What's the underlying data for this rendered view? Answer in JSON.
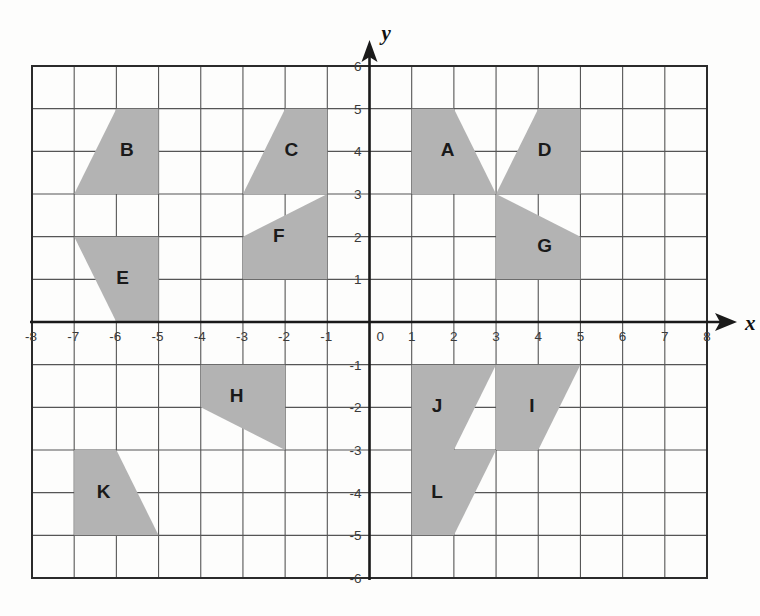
{
  "figure": {
    "type": "coordinate-grid",
    "background_color": "#fdfdfc",
    "grid_line_color": "#555555",
    "grid_border_color": "#2b2b2b",
    "axis_color": "#1a1a1a",
    "shape_fill_color": "#b3b3b3",
    "shape_label_color": "#1a1a1a",
    "x_axis_name": "x",
    "y_axis_name": "y",
    "origin_label": "0"
  },
  "chart_data": {
    "type": "scatter",
    "title": "",
    "xlabel": "x",
    "ylabel": "y",
    "xlim": [
      -8,
      8
    ],
    "ylim": [
      -6,
      6
    ],
    "grid": true,
    "legend": "none",
    "x_ticks": [
      -8,
      -7,
      -6,
      -5,
      -4,
      -3,
      -2,
      -1,
      0,
      1,
      2,
      3,
      4,
      5,
      6,
      7,
      8
    ],
    "x_tick_labels": [
      "-8",
      "-7",
      "-6",
      "-5",
      "-4",
      "-3",
      "-2",
      "-1",
      "0",
      "1",
      "2",
      "3",
      "4",
      "5",
      "6",
      "7",
      "8"
    ],
    "y_ticks": [
      6,
      5,
      4,
      3,
      2,
      1,
      -1,
      -2,
      -3,
      -4,
      -5,
      -6
    ],
    "y_tick_labels": [
      "6",
      "5",
      "4",
      "3",
      "2",
      "1",
      "-1",
      "-2",
      "-3",
      "-4",
      "-5",
      "-6"
    ],
    "shapes": [
      {
        "label": "A",
        "label_at": [
          1.85,
          4.0
        ],
        "vertices": [
          [
            1,
            5
          ],
          [
            2,
            5
          ],
          [
            3,
            3
          ],
          [
            1,
            3
          ]
        ]
      },
      {
        "label": "B",
        "label_at": [
          -5.75,
          4.0
        ],
        "vertices": [
          [
            -6,
            5
          ],
          [
            -5,
            5
          ],
          [
            -5,
            3
          ],
          [
            -7,
            3
          ]
        ]
      },
      {
        "label": "C",
        "label_at": [
          -1.85,
          4.0
        ],
        "vertices": [
          [
            -2,
            5
          ],
          [
            -1,
            5
          ],
          [
            -1,
            3
          ],
          [
            -3,
            3
          ]
        ]
      },
      {
        "label": "D",
        "label_at": [
          4.15,
          4.0
        ],
        "vertices": [
          [
            3,
            3
          ],
          [
            4,
            5
          ],
          [
            5,
            5
          ],
          [
            5,
            3
          ]
        ]
      },
      {
        "label": "E",
        "label_at": [
          -5.85,
          1.0
        ],
        "vertices": [
          [
            -7,
            2
          ],
          [
            -5,
            2
          ],
          [
            -5,
            0
          ],
          [
            -6,
            0
          ]
        ]
      },
      {
        "label": "F",
        "label_at": [
          -2.15,
          2.0
        ],
        "vertices": [
          [
            -3,
            2
          ],
          [
            -1,
            3
          ],
          [
            -1,
            1
          ],
          [
            -3,
            1
          ]
        ]
      },
      {
        "label": "G",
        "label_at": [
          4.15,
          1.75
        ],
        "vertices": [
          [
            3,
            3
          ],
          [
            3,
            1
          ],
          [
            5,
            1
          ],
          [
            5,
            2
          ]
        ]
      },
      {
        "label": "H",
        "label_at": [
          -3.15,
          -1.75
        ],
        "vertices": [
          [
            -4,
            -1
          ],
          [
            -2,
            -1
          ],
          [
            -2,
            -3
          ],
          [
            -4,
            -2
          ]
        ]
      },
      {
        "label": "I",
        "label_at": [
          3.85,
          -2.0
        ],
        "vertices": [
          [
            3,
            -1
          ],
          [
            5,
            -1
          ],
          [
            4,
            -3
          ],
          [
            3,
            -3
          ]
        ]
      },
      {
        "label": "J",
        "label_at": [
          1.6,
          -2.0
        ],
        "vertices": [
          [
            1,
            -1
          ],
          [
            3,
            -1
          ],
          [
            2,
            -3
          ],
          [
            1,
            -3
          ]
        ]
      },
      {
        "label": "K",
        "label_at": [
          -6.3,
          -4.0
        ],
        "vertices": [
          [
            -7,
            -3
          ],
          [
            -6,
            -3
          ],
          [
            -5,
            -5
          ],
          [
            -7,
            -5
          ]
        ]
      },
      {
        "label": "L",
        "label_at": [
          1.6,
          -4.0
        ],
        "vertices": [
          [
            1,
            -3
          ],
          [
            3,
            -3
          ],
          [
            2,
            -5
          ],
          [
            1,
            -5
          ]
        ]
      }
    ]
  }
}
